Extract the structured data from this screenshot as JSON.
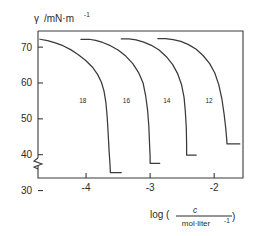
{
  "chart_data": {
    "type": "line",
    "title": "",
    "xlabel": "log ( c / mol·liter⁻¹ )",
    "xlabel_parts": {
      "prefix": "log (",
      "numerator": "c",
      "denominator": "mol·liter",
      "denominator_sup": "-1",
      "suffix": ")"
    },
    "ylabel": "γ /mN·m⁻¹",
    "ylabel_parts": {
      "symbol": "γ",
      "unit": "/mN·m",
      "unit_sup": "-1"
    },
    "xlim": [
      -4.75,
      -1.55
    ],
    "ylim": [
      33.5,
      74.5
    ],
    "xticks": [
      -4,
      -3,
      -2
    ],
    "xticklabels": [
      "-4",
      "-3",
      "-2"
    ],
    "yticks": [
      30,
      40,
      50,
      60,
      70
    ],
    "yticklabels": [
      "30",
      "40",
      "50",
      "60",
      "70"
    ],
    "y_axis_break": true,
    "y_axis_break_below": 30,
    "grid": false,
    "legend_position": "inline-curve-labels",
    "series": [
      {
        "name": "18",
        "label": "18",
        "label_x": -4.05,
        "label_y": 54.5,
        "cmc_x": -3.62,
        "cmc_y": 35.0,
        "points": [
          [
            -4.72,
            72.2
          ],
          [
            -4.6,
            71.8
          ],
          [
            -4.48,
            71.2
          ],
          [
            -4.36,
            70.4
          ],
          [
            -4.24,
            69.3
          ],
          [
            -4.12,
            67.9
          ],
          [
            -4.0,
            66.2
          ],
          [
            -3.9,
            64.4
          ],
          [
            -3.82,
            62.4
          ],
          [
            -3.76,
            60.2
          ],
          [
            -3.72,
            57.8
          ],
          [
            -3.69,
            54.5
          ],
          [
            -3.67,
            50.5
          ],
          [
            -3.655,
            46.0
          ],
          [
            -3.64,
            41.0
          ],
          [
            -3.625,
            37.0
          ],
          [
            -3.62,
            35.0
          ],
          [
            -3.45,
            35.0
          ]
        ]
      },
      {
        "name": "16",
        "label": "16",
        "label_x": -3.37,
        "label_y": 54.5,
        "cmc_x": -3.0,
        "cmc_y": 37.6,
        "points": [
          [
            -4.08,
            72.2
          ],
          [
            -3.95,
            72.2
          ],
          [
            -3.85,
            71.9
          ],
          [
            -3.74,
            71.3
          ],
          [
            -3.62,
            70.4
          ],
          [
            -3.5,
            69.2
          ],
          [
            -3.38,
            67.5
          ],
          [
            -3.27,
            65.4
          ],
          [
            -3.18,
            62.9
          ],
          [
            -3.11,
            60.0
          ],
          [
            -3.07,
            56.5
          ],
          [
            -3.04,
            52.5
          ],
          [
            -3.02,
            48.0
          ],
          [
            -3.01,
            43.5
          ],
          [
            -3.0,
            39.5
          ],
          [
            -3.0,
            37.6
          ],
          [
            -2.85,
            37.6
          ]
        ]
      },
      {
        "name": "14",
        "label": "14",
        "label_x": -2.74,
        "label_y": 54.5,
        "cmc_x": -2.43,
        "cmc_y": 39.9,
        "points": [
          [
            -3.45,
            72.3
          ],
          [
            -3.33,
            72.3
          ],
          [
            -3.22,
            72.0
          ],
          [
            -3.1,
            71.4
          ],
          [
            -2.98,
            70.5
          ],
          [
            -2.86,
            69.2
          ],
          [
            -2.75,
            67.4
          ],
          [
            -2.65,
            65.2
          ],
          [
            -2.57,
            62.6
          ],
          [
            -2.51,
            59.6
          ],
          [
            -2.47,
            56.0
          ],
          [
            -2.45,
            52.0
          ],
          [
            -2.435,
            47.5
          ],
          [
            -2.43,
            43.0
          ],
          [
            -2.43,
            39.9
          ],
          [
            -2.28,
            39.9
          ]
        ]
      },
      {
        "name": "12",
        "label": "12",
        "label_x": -2.08,
        "label_y": 54.5,
        "cmc_x": -1.8,
        "cmc_y": 43.0,
        "points": [
          [
            -2.88,
            72.4
          ],
          [
            -2.76,
            72.4
          ],
          [
            -2.64,
            72.1
          ],
          [
            -2.52,
            71.6
          ],
          [
            -2.4,
            70.7
          ],
          [
            -2.28,
            69.4
          ],
          [
            -2.17,
            67.6
          ],
          [
            -2.07,
            65.4
          ],
          [
            -1.99,
            62.8
          ],
          [
            -1.93,
            59.6
          ],
          [
            -1.88,
            55.6
          ],
          [
            -1.845,
            51.3
          ],
          [
            -1.82,
            47.5
          ],
          [
            -1.805,
            44.5
          ],
          [
            -1.8,
            43.0
          ],
          [
            -1.6,
            43.0
          ]
        ]
      }
    ]
  }
}
